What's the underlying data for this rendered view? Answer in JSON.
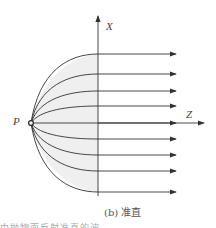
{
  "diagram": {
    "axis_x_label": "X",
    "axis_z_label": "Z",
    "point_label": "P",
    "caption": "(b) 准直",
    "truncated_text": "由抛物面反射准直的波",
    "ray_count": 9,
    "colors": {
      "line": "#333333",
      "fill": "#efefef"
    }
  }
}
